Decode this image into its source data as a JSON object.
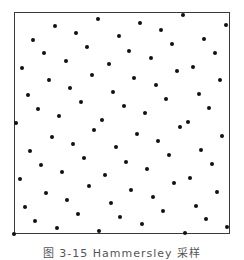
{
  "figure": {
    "caption": "图 3-15  Hammersley 采样",
    "frame": {
      "left": 14,
      "top": 12,
      "right": 230,
      "bottom": 234
    },
    "dot_color": "#111111",
    "frame_color": "#3a3a3a",
    "points": [
      [
        183,
        15
      ],
      [
        98,
        19
      ],
      [
        140,
        23
      ],
      [
        55,
        26
      ],
      [
        226,
        25
      ],
      [
        161,
        30
      ],
      [
        76,
        33
      ],
      [
        119,
        36
      ],
      [
        204,
        39
      ],
      [
        33,
        40
      ],
      [
        172,
        44
      ],
      [
        87,
        47
      ],
      [
        129,
        51
      ],
      [
        44,
        53
      ],
      [
        215,
        53
      ],
      [
        151,
        58
      ],
      [
        66,
        61
      ],
      [
        109,
        64
      ],
      [
        193,
        67
      ],
      [
        22,
        68
      ],
      [
        177,
        71
      ],
      [
        92,
        75
      ],
      [
        134,
        78
      ],
      [
        220,
        80
      ],
      [
        49,
        80
      ],
      [
        156,
        85
      ],
      [
        70,
        88
      ],
      [
        113,
        92
      ],
      [
        199,
        94
      ],
      [
        28,
        95
      ],
      [
        166,
        99
      ],
      [
        81,
        102
      ],
      [
        124,
        106
      ],
      [
        209,
        108
      ],
      [
        38,
        109
      ],
      [
        145,
        113
      ],
      [
        59,
        116
      ],
      [
        102,
        120
      ],
      [
        188,
        122
      ],
      [
        16,
        123
      ],
      [
        180,
        127
      ],
      [
        94,
        130
      ],
      [
        137,
        134
      ],
      [
        222,
        136
      ],
      [
        52,
        137
      ],
      [
        158,
        141
      ],
      [
        73,
        144
      ],
      [
        116,
        147
      ],
      [
        201,
        150
      ],
      [
        30,
        151
      ],
      [
        169,
        155
      ],
      [
        84,
        158
      ],
      [
        126,
        162
      ],
      [
        212,
        164
      ],
      [
        41,
        165
      ],
      [
        147,
        169
      ],
      [
        62,
        172
      ],
      [
        105,
        175
      ],
      [
        190,
        178
      ],
      [
        20,
        179
      ],
      [
        174,
        183
      ],
      [
        89,
        186
      ],
      [
        131,
        190
      ],
      [
        217,
        192
      ],
      [
        46,
        193
      ],
      [
        153,
        197
      ],
      [
        67,
        200
      ],
      [
        111,
        203
      ],
      [
        196,
        206
      ],
      [
        25,
        207
      ],
      [
        163,
        211
      ],
      [
        78,
        214
      ],
      [
        120,
        217
      ],
      [
        206,
        219
      ],
      [
        35,
        221
      ],
      [
        142,
        224
      ],
      [
        57,
        228
      ],
      [
        227,
        227
      ],
      [
        99,
        231
      ],
      [
        185,
        233
      ],
      [
        14,
        234
      ]
    ]
  }
}
